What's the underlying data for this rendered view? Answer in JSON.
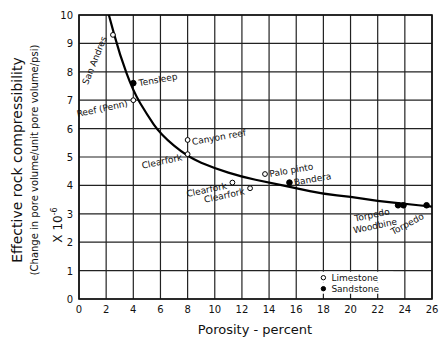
{
  "chart_data": {
    "type": "scatter",
    "title": "",
    "xlabel": "Porosity - percent",
    "ylabel": "Effective rock compressibility",
    "ylabel_sub": "(Change in pore volume/unit pore volume/psi)",
    "y_multiplier": "X 10-6",
    "xlim": [
      0,
      26
    ],
    "ylim": [
      0,
      10
    ],
    "x_ticks": [
      0,
      2,
      4,
      6,
      8,
      10,
      12,
      14,
      16,
      18,
      20,
      22,
      24,
      26
    ],
    "y_ticks": [
      0,
      1,
      2,
      3,
      4,
      5,
      6,
      7,
      8,
      9,
      10
    ],
    "grid": true,
    "legend": {
      "position": "lower-right",
      "entries": [
        {
          "label": "Limestone",
          "marker": "open-circle"
        },
        {
          "label": "Sandstone",
          "marker": "filled-circle"
        }
      ]
    },
    "series": [
      {
        "name": "Limestone",
        "marker": "open-circle",
        "points": [
          {
            "label": "San Andres",
            "x": 2.5,
            "y": 9.3
          },
          {
            "label": "Reef (Penn)",
            "x": 4.0,
            "y": 7.0
          },
          {
            "label": "Canyon reef",
            "x": 8.0,
            "y": 5.6
          },
          {
            "label": "Clearfork",
            "x": 8.0,
            "y": 5.1
          },
          {
            "label": "Clearfork",
            "x": 11.3,
            "y": 4.1
          },
          {
            "label": "Clearfork",
            "x": 12.6,
            "y": 3.9
          },
          {
            "label": "Palo pinto",
            "x": 13.7,
            "y": 4.4
          }
        ]
      },
      {
        "name": "Sandstone",
        "marker": "filled-circle",
        "points": [
          {
            "label": "Tensleep",
            "x": 4.0,
            "y": 7.6
          },
          {
            "label": "Bandera",
            "x": 15.5,
            "y": 4.1
          },
          {
            "label": "Torpedo",
            "x": 23.5,
            "y": 3.3
          },
          {
            "label": "Woodbine",
            "x": 23.9,
            "y": 3.3
          },
          {
            "label": "Torpedo",
            "x": 25.6,
            "y": 3.3
          }
        ]
      },
      {
        "name": "Fitted curve",
        "type": "line",
        "x": [
          2.2,
          3,
          4,
          5,
          6,
          8,
          10,
          12,
          14,
          16,
          18,
          20,
          22,
          24,
          26
        ],
        "y": [
          10.0,
          8.6,
          7.3,
          6.5,
          5.8,
          5.0,
          4.6,
          4.3,
          4.1,
          3.9,
          3.7,
          3.6,
          3.45,
          3.35,
          3.25
        ]
      }
    ]
  }
}
